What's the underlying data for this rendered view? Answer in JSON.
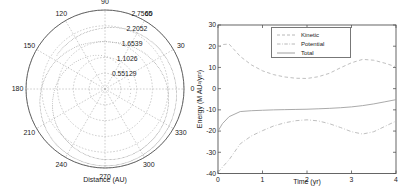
{
  "colors": {
    "background": "#ffffff",
    "axis": "#555555",
    "text": "#1a1a1a",
    "polar_grid": "#b8b8b8",
    "trajectory_dots": "#8f8f8f",
    "kinetic_line": "#b8b8b8",
    "potential_line": "#b8b8b8",
    "total_line": "#a0a0a0"
  },
  "chart_data": [
    {
      "type": "scatter",
      "kind": "polar-dotted-trajectory",
      "xlabel": "Distance (AU)",
      "rmax": 2.7565,
      "angle_ticks_deg": [
        0,
        30,
        60,
        90,
        120,
        150,
        180,
        210,
        240,
        270,
        300,
        330
      ],
      "angle_tick_labels": [
        "0",
        "30",
        "60",
        "90",
        "120",
        "150",
        "180",
        "210",
        "240",
        "270",
        "300",
        "330"
      ],
      "radial_ticks": [
        0.55129,
        1.1026,
        1.6539,
        2.2052,
        2.7565
      ],
      "radial_tick_labels": [
        "0.55129",
        "1.1026",
        "1.6539",
        "2.2052",
        "2.7565"
      ],
      "radial_label_angle_deg": 72,
      "grid": true,
      "trajectory_polar_control_points": {
        "theta_deg": [
          -25,
          15,
          55,
          90,
          135,
          180,
          225,
          270,
          315,
          355,
          400,
          430,
          450,
          480,
          520,
          560,
          590,
          630,
          670,
          710,
          750,
          790,
          820,
          865
        ],
        "r_au": [
          0.92,
          0.87,
          0.95,
          1.15,
          1.38,
          1.75,
          2.18,
          2.46,
          2.42,
          2.22,
          1.88,
          1.7,
          1.65,
          1.76,
          2.05,
          2.38,
          2.58,
          2.68,
          2.63,
          2.52,
          2.38,
          2.22,
          2.1,
          2.05
        ]
      }
    },
    {
      "type": "line",
      "xlabel": "Time (yr)",
      "ylabel": "Energy (M AU²/yr²)",
      "xlim": [
        0,
        4
      ],
      "ylim": [
        -40,
        30
      ],
      "xticks": [
        0,
        1,
        2,
        3,
        4
      ],
      "xtick_labels": [
        "0",
        "1",
        "2",
        "3",
        "4"
      ],
      "yticks": [
        30,
        20,
        10,
        0,
        -10,
        -20,
        -30,
        -40
      ],
      "ytick_labels": [
        "30",
        "20",
        "10",
        "0",
        "-10",
        "-20",
        "-30",
        "-40"
      ],
      "grid": false,
      "legend_position": "upper center inside",
      "x": [
        0,
        0.1,
        0.25,
        0.5,
        0.75,
        1,
        1.25,
        1.5,
        1.75,
        2,
        2.25,
        2.5,
        2.75,
        3,
        3.25,
        3.5,
        3.75,
        4
      ],
      "series": [
        {
          "name": "Kinetic",
          "style": "dashed",
          "values": [
            19.5,
            20.8,
            21.0,
            15.2,
            11.2,
            8.4,
            6.6,
            5.5,
            4.9,
            4.8,
            5.6,
            7.2,
            9.8,
            12.2,
            13.8,
            13.4,
            12.0,
            10.3
          ]
        },
        {
          "name": "Potential",
          "style": "dashdot",
          "values": [
            -39.5,
            -37.0,
            -33.5,
            -26.0,
            -22.3,
            -19.8,
            -17.6,
            -16.1,
            -15.1,
            -14.7,
            -15.2,
            -16.5,
            -18.3,
            -20.3,
            -21.4,
            -20.3,
            -17.8,
            -15.3
          ]
        },
        {
          "name": "Total",
          "style": "solid",
          "values": [
            -20.0,
            -16.5,
            -13.2,
            -10.8,
            -10.4,
            -10.2,
            -10.0,
            -9.9,
            -9.8,
            -9.7,
            -9.5,
            -9.3,
            -9.0,
            -8.6,
            -8.0,
            -7.2,
            -6.2,
            -5.2
          ]
        }
      ]
    }
  ]
}
